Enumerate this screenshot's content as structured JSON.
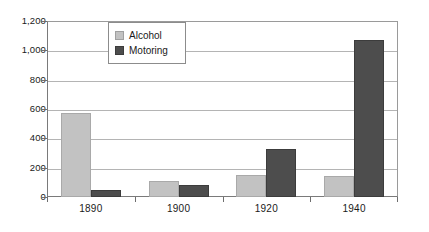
{
  "chart_data": {
    "type": "bar",
    "title": "",
    "subtitle": "",
    "xlabel": "",
    "ylabel": "",
    "categories": [
      "1890",
      "1900",
      "1920",
      "1940"
    ],
    "series": [
      {
        "name": "Alcohol",
        "color": "#c2c2c2",
        "values": [
          570,
          110,
          150,
          145
        ]
      },
      {
        "name": "Motoring",
        "color": "#4d4d4d",
        "values": [
          50,
          85,
          330,
          1070
        ]
      }
    ],
    "ylim": [
      0,
      1200
    ],
    "yticks": [
      0,
      200,
      400,
      600,
      800,
      1000,
      1200
    ],
    "ytick_labels": [
      "0",
      "200",
      "400",
      "600",
      "800",
      "1,000",
      "1,200"
    ],
    "grid": true,
    "legend_position": "top-left-inside",
    "legend_entries": [
      "Alcohol",
      "Motoring"
    ]
  }
}
